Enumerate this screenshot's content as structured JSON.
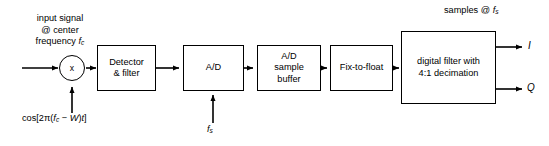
{
  "diagram": {
    "background_color": "#ffffff",
    "line_color": "#000000"
  },
  "annotations": {
    "samples_rate": "samples @ ",
    "samples_rate_sub": "f",
    "samples_rate_sub2": "s",
    "input_line1": "input signal",
    "input_line2": "@ center",
    "input_line3": "frequency ",
    "input_line3_var": "f",
    "input_line3_sub": "c",
    "local_oscillator_pre": "cos[2π(",
    "local_oscillator_fc": "f",
    "local_oscillator_fc_sub": "c",
    "local_oscillator_mid": " − ",
    "local_oscillator_w": "W",
    "local_oscillator_post": ")",
    "local_oscillator_t": "t",
    "local_oscillator_end": "]",
    "sample_clock": "f",
    "sample_clock_sub": "s"
  },
  "blocks": [
    {
      "id": "multiplier",
      "label": "x"
    },
    {
      "id": "detector",
      "label": "Detector\n& filter"
    },
    {
      "id": "adc",
      "label": "A/D"
    },
    {
      "id": "buffer",
      "label": "A/D\nsample\nbuffer"
    },
    {
      "id": "fixtofloat",
      "label": "Fix-to-float"
    },
    {
      "id": "digital_filter",
      "label": "digital filter with\n4:1 decimation"
    }
  ],
  "outputs": {
    "i_label": "I",
    "q_label": "Q"
  }
}
